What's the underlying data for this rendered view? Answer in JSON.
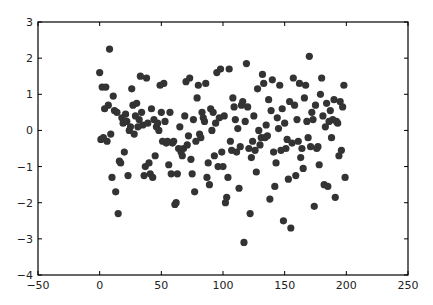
{
  "chart_data": {
    "type": "scatter",
    "title": "",
    "xlabel": "",
    "ylabel": "",
    "xlim": [
      -50,
      250
    ],
    "ylim": [
      -4,
      3
    ],
    "xticks": [
      -50,
      0,
      50,
      100,
      150,
      200,
      250
    ],
    "yticks": [
      -4,
      -3,
      -2,
      -1,
      0,
      1,
      2,
      3
    ],
    "grid": false,
    "legend": null,
    "marker_color": "#333333",
    "series": [
      {
        "name": "points",
        "points": [
          [
            0,
            1.6
          ],
          [
            1,
            -0.25
          ],
          [
            2,
            1.2
          ],
          [
            3,
            -0.2
          ],
          [
            4,
            0.6
          ],
          [
            5,
            1.2
          ],
          [
            6,
            -0.3
          ],
          [
            7,
            0.7
          ],
          [
            8,
            2.25
          ],
          [
            9,
            -0.1
          ],
          [
            10,
            -1.3
          ],
          [
            11,
            0.95
          ],
          [
            12,
            0.55
          ],
          [
            13,
            -1.7
          ],
          [
            14,
            0.5
          ],
          [
            15,
            -2.3
          ],
          [
            16,
            -0.85
          ],
          [
            17,
            -0.9
          ],
          [
            18,
            0.35
          ],
          [
            19,
            0.2
          ],
          [
            20,
            -0.6
          ],
          [
            21,
            0.45
          ],
          [
            22,
            0.25
          ],
          [
            23,
            -1.25
          ],
          [
            24,
            0.0
          ],
          [
            25,
            0.1
          ],
          [
            26,
            1.15
          ],
          [
            27,
            0.7
          ],
          [
            28,
            -0.1
          ],
          [
            29,
            0.4
          ],
          [
            30,
            0.75
          ],
          [
            31,
            0.1
          ],
          [
            32,
            0.3
          ],
          [
            33,
            1.5
          ],
          [
            34,
            0.5
          ],
          [
            35,
            0.15
          ],
          [
            36,
            -1.25
          ],
          [
            37,
            -1.0
          ],
          [
            38,
            1.45
          ],
          [
            39,
            0.2
          ],
          [
            40,
            -0.9
          ],
          [
            41,
            -1.2
          ],
          [
            42,
            0.6
          ],
          [
            43,
            -1.3
          ],
          [
            44,
            0.3
          ],
          [
            45,
            -0.7
          ],
          [
            46,
            0.1
          ],
          [
            47,
            0.2
          ],
          [
            48,
            0.0
          ],
          [
            49,
            1.25
          ],
          [
            50,
            0.5
          ],
          [
            51,
            -0.3
          ],
          [
            52,
            1.3
          ],
          [
            53,
            0.25
          ],
          [
            54,
            -0.35
          ],
          [
            55,
            -0.3
          ],
          [
            56,
            -0.95
          ],
          [
            57,
            0.5
          ],
          [
            58,
            -1.2
          ],
          [
            59,
            -0.35
          ],
          [
            60,
            -0.3
          ],
          [
            61,
            -2.05
          ],
          [
            62,
            -2.0
          ],
          [
            63,
            -1.2
          ],
          [
            64,
            -0.5
          ],
          [
            65,
            0.1
          ],
          [
            66,
            -0.6
          ],
          [
            67,
            -0.7
          ],
          [
            68,
            -0.5
          ],
          [
            69,
            0.4
          ],
          [
            70,
            1.35
          ],
          [
            71,
            -0.4
          ],
          [
            72,
            -0.15
          ],
          [
            73,
            1.45
          ],
          [
            74,
            -0.8
          ],
          [
            75,
            -1.2
          ],
          [
            76,
            0.3
          ],
          [
            77,
            -1.7
          ],
          [
            78,
            -0.3
          ],
          [
            79,
            0.9
          ],
          [
            80,
            1.25
          ],
          [
            81,
            -0.1
          ],
          [
            82,
            -0.2
          ],
          [
            83,
            0.5
          ],
          [
            84,
            0.35
          ],
          [
            85,
            0.25
          ],
          [
            86,
            1.3
          ],
          [
            87,
            -1.3
          ],
          [
            88,
            -0.9
          ],
          [
            89,
            -1.5
          ],
          [
            90,
            0.6
          ],
          [
            91,
            0.0
          ],
          [
            92,
            0.5
          ],
          [
            93,
            -0.7
          ],
          [
            94,
            0.2
          ],
          [
            95,
            1.6
          ],
          [
            96,
            -1.0
          ],
          [
            97,
            0.35
          ],
          [
            98,
            1.7
          ],
          [
            99,
            -0.6
          ],
          [
            100,
            -1.0
          ],
          [
            101,
            0.4
          ],
          [
            102,
            -2.0
          ],
          [
            103,
            -1.85
          ],
          [
            104,
            -1.3
          ],
          [
            105,
            1.7
          ],
          [
            106,
            -0.3
          ],
          [
            107,
            -0.55
          ],
          [
            108,
            0.9
          ],
          [
            109,
            0.65
          ],
          [
            110,
            0.3
          ],
          [
            111,
            -0.6
          ],
          [
            112,
            0.05
          ],
          [
            113,
            -1.6
          ],
          [
            114,
            -0.45
          ],
          [
            115,
            0.7
          ],
          [
            116,
            0.8
          ],
          [
            117,
            -3.1
          ],
          [
            118,
            0.25
          ],
          [
            119,
            1.85
          ],
          [
            120,
            0.65
          ],
          [
            121,
            -0.5
          ],
          [
            122,
            -2.3
          ],
          [
            123,
            -0.75
          ],
          [
            124,
            -0.3
          ],
          [
            125,
            0.4
          ],
          [
            126,
            -0.55
          ],
          [
            127,
            -1.15
          ],
          [
            128,
            1.15
          ],
          [
            129,
            0.0
          ],
          [
            130,
            -0.4
          ],
          [
            131,
            -0.2
          ],
          [
            132,
            1.55
          ],
          [
            133,
            1.3
          ],
          [
            134,
            -0.2
          ],
          [
            135,
            0.15
          ],
          [
            136,
            -0.15
          ],
          [
            137,
            0.85
          ],
          [
            138,
            -1.9
          ],
          [
            139,
            0.55
          ],
          [
            140,
            1.4
          ],
          [
            141,
            -0.6
          ],
          [
            142,
            -1.55
          ],
          [
            143,
            -0.9
          ],
          [
            144,
            0.35
          ],
          [
            145,
            0.05
          ],
          [
            146,
            1.25
          ],
          [
            147,
            -0.55
          ],
          [
            148,
            0.6
          ],
          [
            149,
            -2.5
          ],
          [
            150,
            0.2
          ],
          [
            151,
            -0.5
          ],
          [
            152,
            -0.25
          ],
          [
            153,
            -1.35
          ],
          [
            154,
            0.8
          ],
          [
            155,
            -2.7
          ],
          [
            156,
            -0.35
          ],
          [
            157,
            1.45
          ],
          [
            158,
            0.7
          ],
          [
            159,
            -1.25
          ],
          [
            160,
            0.3
          ],
          [
            161,
            -0.3
          ],
          [
            162,
            1.3
          ],
          [
            163,
            -0.75
          ],
          [
            164,
            -0.5
          ],
          [
            165,
            -1.05
          ],
          [
            166,
            0.9
          ],
          [
            167,
            1.25
          ],
          [
            168,
            0.25
          ],
          [
            169,
            -0.2
          ],
          [
            170,
            2.05
          ],
          [
            171,
            -0.45
          ],
          [
            172,
            0.5
          ],
          [
            173,
            0.3
          ],
          [
            174,
            -2.1
          ],
          [
            175,
            0.7
          ],
          [
            176,
            -0.5
          ],
          [
            177,
            -0.45
          ],
          [
            178,
            -0.95
          ],
          [
            179,
            1.0
          ],
          [
            180,
            1.45
          ],
          [
            181,
            0.4
          ],
          [
            182,
            -1.5
          ],
          [
            183,
            0.1
          ],
          [
            184,
            0.75
          ],
          [
            185,
            -1.55
          ],
          [
            186,
            0.25
          ],
          [
            187,
            0.55
          ],
          [
            188,
            -0.2
          ],
          [
            189,
            0.3
          ],
          [
            190,
            0.85
          ],
          [
            191,
            -1.85
          ],
          [
            192,
            0.25
          ],
          [
            193,
            0.2
          ],
          [
            194,
            -0.7
          ],
          [
            195,
            0.8
          ],
          [
            196,
            -0.55
          ],
          [
            197,
            0.65
          ],
          [
            198,
            1.25
          ],
          [
            199,
            -1.3
          ]
        ]
      }
    ]
  }
}
